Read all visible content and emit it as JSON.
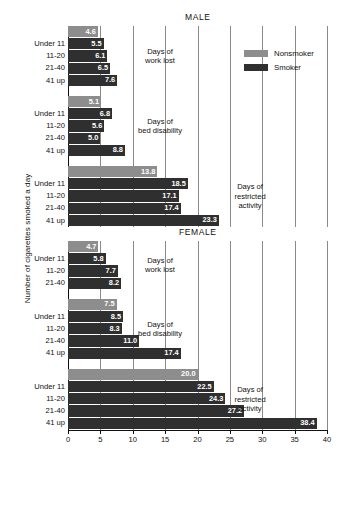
{
  "chart_data": {
    "type": "bar",
    "title": "",
    "xlabel": "",
    "ylabel": "Number of cigarettes smoked a day",
    "xlim": [
      0,
      40
    ],
    "xticks": [
      0,
      5,
      10,
      15,
      20,
      25,
      30,
      35,
      40
    ],
    "orientation": "horizontal",
    "grid": true,
    "legend_position": "top-right",
    "series": [
      {
        "name": "Nonsmoker",
        "color": "#8d8d8d"
      },
      {
        "name": "Smoker",
        "color": "#2f2f2f"
      }
    ],
    "categories": [
      "Nonsmoker",
      "Under 11",
      "11-20",
      "21-40",
      "41 up"
    ],
    "panels": [
      {
        "label": "MALE",
        "groups": [
          {
            "measure": "Days of\nwork lost",
            "measure_line1": "Days of",
            "measure_line2": "work lost",
            "measure_line3": "",
            "rows": [
              {
                "label": "",
                "series": "Nonsmoker",
                "value": 4.6
              },
              {
                "label": "Under 11",
                "series": "Smoker",
                "value": 5.5
              },
              {
                "label": "11-20",
                "series": "Smoker",
                "value": 6.1
              },
              {
                "label": "21-40",
                "series": "Smoker",
                "value": 6.5
              },
              {
                "label": "41 up",
                "series": "Smoker",
                "value": 7.6
              }
            ]
          },
          {
            "measure_line1": "Days of",
            "measure_line2": "bed disability",
            "measure_line3": "",
            "rows": [
              {
                "label": "",
                "series": "Nonsmoker",
                "value": 5.1
              },
              {
                "label": "Under 11",
                "series": "Smoker",
                "value": 6.8
              },
              {
                "label": "11-20",
                "series": "Smoker",
                "value": 5.6
              },
              {
                "label": "21-40",
                "series": "Smoker",
                "value": 5.0
              },
              {
                "label": "41 up",
                "series": "Smoker",
                "value": 8.8
              }
            ]
          },
          {
            "measure_line1": "Days of",
            "measure_line2": "restricted",
            "measure_line3": "activity",
            "rows": [
              {
                "label": "",
                "series": "Nonsmoker",
                "value": 13.8
              },
              {
                "label": "Under 11",
                "series": "Smoker",
                "value": 18.5
              },
              {
                "label": "11-20",
                "series": "Smoker",
                "value": 17.1
              },
              {
                "label": "21-40",
                "series": "Smoker",
                "value": 17.4
              },
              {
                "label": "41 up",
                "series": "Smoker",
                "value": 23.3
              }
            ]
          }
        ]
      },
      {
        "label": "FEMALE",
        "groups": [
          {
            "measure_line1": "Days of",
            "measure_line2": "work lost",
            "measure_line3": "",
            "rows": [
              {
                "label": "",
                "series": "Nonsmoker",
                "value": 4.7
              },
              {
                "label": "Under 11",
                "series": "Smoker",
                "value": 5.8
              },
              {
                "label": "11-20",
                "series": "Smoker",
                "value": 7.7
              },
              {
                "label": "21-40",
                "series": "Smoker",
                "value": 8.2
              }
            ]
          },
          {
            "measure_line1": "Days of",
            "measure_line2": "bed disability",
            "measure_line3": "",
            "rows": [
              {
                "label": "",
                "series": "Nonsmoker",
                "value": 7.5
              },
              {
                "label": "Under 11",
                "series": "Smoker",
                "value": 8.5
              },
              {
                "label": "11-20",
                "series": "Smoker",
                "value": 8.3
              },
              {
                "label": "21-40",
                "series": "Smoker",
                "value": 11.0
              },
              {
                "label": "41 up",
                "series": "Smoker",
                "value": 17.4
              }
            ]
          },
          {
            "measure_line1": "Days of",
            "measure_line2": "restricted",
            "measure_line3": "activity",
            "rows": [
              {
                "label": "",
                "series": "Nonsmoker",
                "value": 20.0
              },
              {
                "label": "Under 11",
                "series": "Smoker",
                "value": 22.5
              },
              {
                "label": "11-20",
                "series": "Smoker",
                "value": 24.3
              },
              {
                "label": "21-40",
                "series": "Smoker",
                "value": 27.2
              },
              {
                "label": "41 up",
                "series": "Smoker",
                "value": 38.4
              }
            ]
          }
        ]
      }
    ]
  },
  "legend": {
    "nonsmoker_label": "Nonsmoker",
    "smoker_label": "Smoker"
  },
  "axis": {
    "ylabel": "Number of cigarettes smoked a day",
    "ticks": [
      "0",
      "5",
      "10",
      "15",
      "20",
      "25",
      "30",
      "35",
      "40"
    ]
  },
  "panel_titles": {
    "male": "MALE",
    "female": "FEMALE"
  },
  "colors": {
    "nonsmoker": "#8d8d8d",
    "smoker": "#2f2f2f",
    "grid": "#8a8a8a",
    "axis": "#111111",
    "background": "#ffffff"
  }
}
